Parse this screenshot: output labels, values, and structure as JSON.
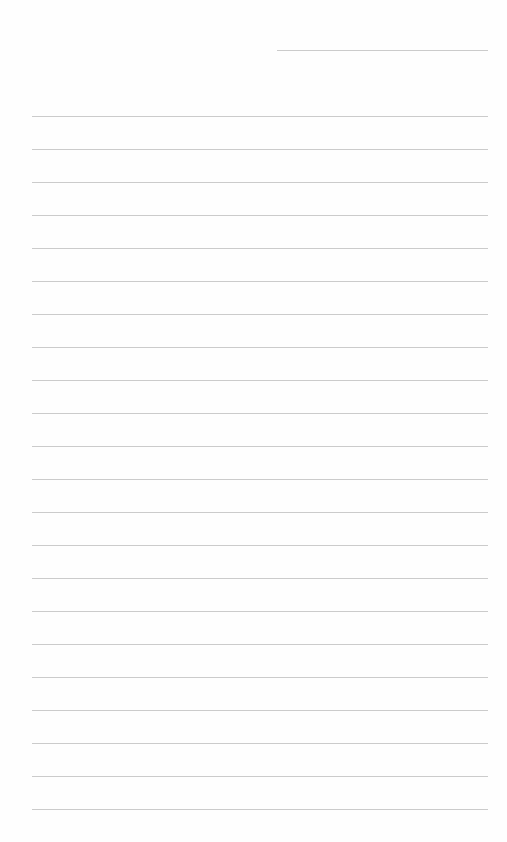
{
  "page": {
    "type": "lined-paper",
    "background_color": "#fefefe",
    "line_color": "#cbcbcb",
    "header_line": {
      "left": 277,
      "top": 50,
      "width": 211
    },
    "rules": {
      "left": 32,
      "width": 456,
      "first_top": 116,
      "spacing": 33,
      "count": 22
    }
  }
}
